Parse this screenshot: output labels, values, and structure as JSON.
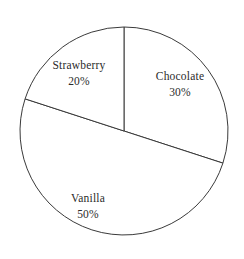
{
  "chart_data": {
    "type": "pie",
    "title": "",
    "categories": [
      "Chocolate",
      "Vanilla",
      "Strawberry"
    ],
    "values": [
      30,
      50,
      20
    ],
    "value_unit": "%",
    "labels": [
      {
        "name": "Chocolate",
        "value_text": "30%",
        "value": 30
      },
      {
        "name": "Vanilla",
        "value_text": "50%",
        "value": 50
      },
      {
        "name": "Strawberry",
        "value_text": "20%",
        "value": 20
      }
    ],
    "legend": "none",
    "legend_position": "inside-slice",
    "grid": false,
    "start_angle_deg": 0,
    "direction": "clockwise",
    "slice_fill": "#ffffff",
    "outline_color": "#3a3a3a",
    "background_color": "#ffffff",
    "text_color": "#2b2b2b",
    "geometry": {
      "center_x": 124,
      "center_y": 131,
      "radius": 104
    }
  }
}
